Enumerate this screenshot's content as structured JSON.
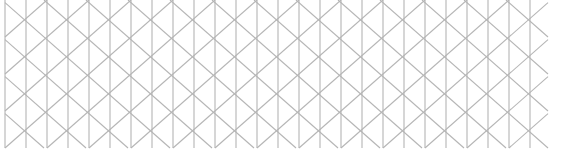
{
  "figure": {
    "canvas": {
      "width": 563,
      "height": 157,
      "background_color": "#ffffff"
    },
    "style": {
      "line_color": "#b5b5b5",
      "line_width": 1.1,
      "line_cap": "butt"
    },
    "lattice": {
      "type": "triangular",
      "origin_x": 5,
      "origin_y": 0,
      "column_spacing": 21,
      "row_spacing": 18.5,
      "columns": 26,
      "rows": 8,
      "grid_right_edge": 548,
      "grid_bottom_edge": 148,
      "line_families": [
        "vertical",
        "diagonal-down-right",
        "diagonal-up-right"
      ],
      "vertical_line_count": 27,
      "diagonal_slope_run": 21,
      "diagonal_slope_rise": 18.5
    },
    "margins": {
      "left": 5,
      "top": 0,
      "right": 15,
      "bottom": 9
    }
  }
}
